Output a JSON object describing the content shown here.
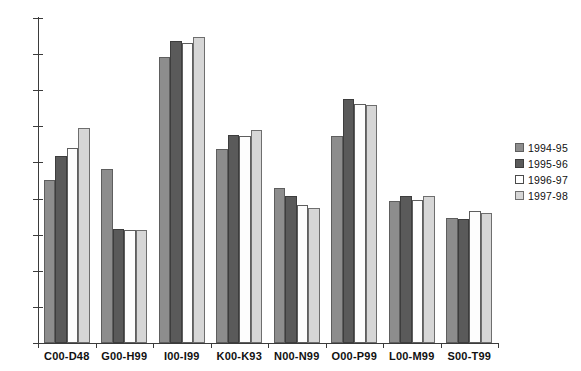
{
  "chart_data": {
    "type": "bar",
    "title": "",
    "subtitle": "",
    "xlabel": "",
    "ylabel": "",
    "ylim": [
      0,
      1800
    ],
    "ytick_step": 200,
    "yticks": [
      0,
      200,
      400,
      600,
      800,
      1000,
      1200,
      1400,
      1600,
      1800
    ],
    "grid": false,
    "legend_position": "right",
    "orientation": "vertical",
    "grouping": "clustered",
    "categories": [
      "C00-D48",
      "G00-H99",
      "I00-I99",
      "K00-K93",
      "N00-N99",
      "O00-P99",
      "L00-M99",
      "S00-T99"
    ],
    "series": [
      {
        "name": "1994-95",
        "color": "#8d8d8d",
        "values": [
          905,
          965,
          1585,
          1075,
          860,
          1145,
          785,
          695
        ]
      },
      {
        "name": "1995-96",
        "color": "#5a5a5a",
        "values": [
          1035,
          630,
          1675,
          1150,
          815,
          1350,
          815,
          685
        ]
      },
      {
        "name": "1996-97",
        "color": "#ffffff",
        "values": [
          1080,
          625,
          1660,
          1145,
          765,
          1325,
          790,
          730
        ]
      },
      {
        "name": "1997-98",
        "color": "#d6d6d6",
        "values": [
          1190,
          625,
          1695,
          1180,
          750,
          1320,
          815,
          720
        ]
      }
    ]
  },
  "legend": {
    "entries": [
      {
        "label": "1994-95"
      },
      {
        "label": "1995-96"
      },
      {
        "label": "1996-97"
      },
      {
        "label": "1997-98"
      }
    ]
  },
  "axes": {
    "y_tick_labels": [
      "1800",
      "1600",
      "1400",
      "1200",
      "1000",
      "800",
      "600",
      "400",
      "200",
      "0"
    ]
  }
}
